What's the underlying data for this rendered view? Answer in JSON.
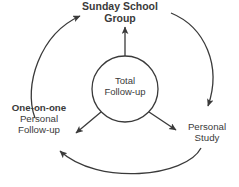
{
  "diagram": {
    "background_color": "#ffffff",
    "stroke_color": "#3a3a3a",
    "text_color": "#3a3a3a",
    "nodes": {
      "center": {
        "name": "total-follow-up",
        "line1": "Total",
        "line2": "Follow-up",
        "shape": "circle",
        "bold": false
      },
      "top": {
        "name": "sunday-school-group",
        "line1": "Sunday School",
        "line2": "Group",
        "bold": true
      },
      "left": {
        "name": "one-on-one-personal-follow-up",
        "line1": "One-on-one",
        "line2": "Personal",
        "line3": "Follow-up",
        "bold_line1": true
      },
      "right": {
        "name": "personal-study",
        "line1": "Personal",
        "line2": "Study",
        "bold": false
      }
    },
    "connectors": [
      {
        "name": "center-to-sunday-school-group",
        "type": "straight-arrow",
        "direction": "up"
      },
      {
        "name": "center-to-one-on-one",
        "type": "straight-arrow",
        "direction": "down-left"
      },
      {
        "name": "center-to-personal-study",
        "type": "straight-arrow",
        "direction": "down-right"
      },
      {
        "name": "one-on-one-to-sunday-school-group",
        "type": "curved-arrow",
        "direction": "counter-clockwise-left-arc"
      },
      {
        "name": "sunday-school-group-to-personal-study",
        "type": "curved-arrow",
        "direction": "clockwise-right-arc"
      },
      {
        "name": "personal-study-to-one-on-one",
        "type": "curved-arrow",
        "direction": "bottom-arc"
      }
    ]
  }
}
